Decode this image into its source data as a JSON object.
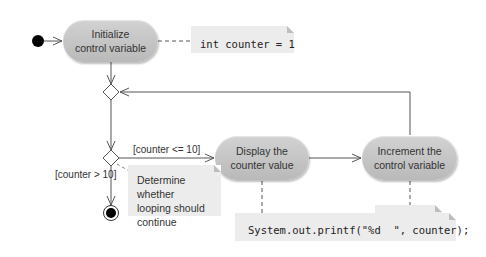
{
  "diagram": {
    "type": "UML activity diagram",
    "activities": {
      "initialize": {
        "line1": "Initialize",
        "line2": "control variable"
      },
      "display": {
        "line1": "Display the",
        "line2": "counter value"
      },
      "increment": {
        "line1": "Increment the",
        "line2": "control variable"
      }
    },
    "notes": {
      "init_code": "int counter = 1",
      "decision_comment": {
        "line1": "Determine whether",
        "line2": "looping should",
        "line3": "continue"
      },
      "increment_code": "counter++",
      "display_code": "System.out.printf(\"%d  \", counter);"
    },
    "guards": {
      "continue": "[counter <= 10]",
      "exit": "[counter > 10]"
    },
    "colors": {
      "activity_fill": "#c4c4c4",
      "note_fill": "#ececec",
      "line": "#555555",
      "node": "#000000"
    }
  }
}
